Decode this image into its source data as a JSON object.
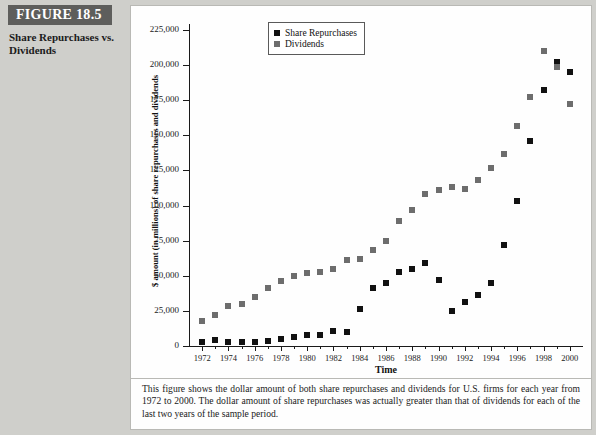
{
  "figure": {
    "banner_label": "FIGURE 18.5",
    "subtitle": "Share Repurchases\nvs. Dividends",
    "caption": "This figure shows the dollar amount of both share repurchases and dividends for U.S. firms for each year from 1972 to 2000. The dollar amount of share repurchases was actually greater than that of dividends for each of the last two years of the sample period."
  },
  "colors": {
    "banner_bg": "#5e5e5c",
    "page_bg": "#cfcfcb",
    "panel_bg": "#fefefe",
    "repurchases": "#111111",
    "dividends": "#6d6d6d"
  },
  "chart_data": {
    "type": "scatter",
    "title": "",
    "xlabel": "Time",
    "ylabel": "$ amount (in millions) of share repurchases and dividends",
    "xlim": [
      1971,
      2001
    ],
    "ylim": [
      0,
      225000
    ],
    "ytick_values": [
      0,
      25000,
      50000,
      75000,
      100000,
      125000,
      150000,
      175000,
      200000,
      225000
    ],
    "ytick_labels": [
      "0",
      "25,000",
      "50,000",
      "75,000",
      "100,000",
      "125,000",
      "150,000",
      "175,000",
      "200,000",
      "225,000"
    ],
    "xtick_values": [
      1972,
      1974,
      1976,
      1978,
      1980,
      1982,
      1984,
      1986,
      1988,
      1990,
      1992,
      1994,
      1996,
      1998,
      2000
    ],
    "xtick_labels": [
      "1972",
      "1974",
      "1976",
      "1978",
      "1980",
      "1982",
      "1984",
      "1986",
      "1988",
      "1990",
      "1992",
      "1994",
      "1996",
      "1998",
      "2000"
    ],
    "minor_xticks_every": 1,
    "grid": false,
    "legend_position": "top-left-inside",
    "x": [
      1972,
      1973,
      1974,
      1975,
      1976,
      1977,
      1978,
      1979,
      1980,
      1981,
      1982,
      1983,
      1984,
      1985,
      1986,
      1987,
      1988,
      1989,
      1990,
      1991,
      1992,
      1993,
      1994,
      1995,
      1996,
      1997,
      1998,
      1999,
      2000
    ],
    "series": [
      {
        "name": "Share Repurchases",
        "color": "#111111",
        "values": [
          3000,
          4500,
          2500,
          2500,
          2500,
          3500,
          5000,
          6500,
          7500,
          8000,
          11000,
          10000,
          26000,
          41000,
          45000,
          53000,
          55000,
          59000,
          47000,
          25000,
          31000,
          36000,
          45000,
          72000,
          103000,
          146000,
          182000,
          202000,
          195000
        ]
      },
      {
        "name": "Dividends",
        "color": "#6d6d6d",
        "values": [
          18000,
          22000,
          28500,
          30000,
          35000,
          41000,
          46000,
          50000,
          52000,
          53000,
          55000,
          61000,
          62000,
          68000,
          75000,
          89000,
          97000,
          108000,
          111000,
          113000,
          112000,
          118000,
          127000,
          137000,
          157000,
          177000,
          210000,
          199000,
          172000
        ]
      }
    ],
    "legend": [
      {
        "label": "Share Repurchases",
        "color": "#111111"
      },
      {
        "label": "Dividends",
        "color": "#6d6d6d"
      }
    ]
  }
}
